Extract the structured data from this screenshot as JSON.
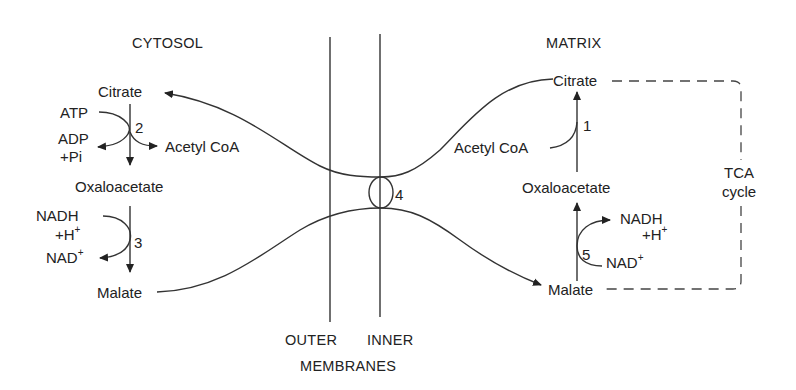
{
  "diagram": {
    "regions": {
      "cytosol": "CYTOSOL",
      "matrix": "MATRIX"
    },
    "membranes": {
      "outer": "OUTER",
      "inner": "INNER",
      "caption": "MEMBRANES"
    },
    "cytosol": {
      "citrate": "Citrate",
      "atp": "ATP",
      "adp": "ADP",
      "pi": "+Pi",
      "acetyl_coa": "Acetyl CoA",
      "oxaloacetate": "Oxaloacetate",
      "nadh": "NADH",
      "h_plus": "+H",
      "h_plus_sup": "+",
      "nad": "NAD",
      "nad_sup": "+",
      "malate": "Malate"
    },
    "matrix": {
      "citrate": "Citrate",
      "acetyl_coa": "Acetyl CoA",
      "oxaloacetate": "Oxaloacetate",
      "nadh": "NADH",
      "h_plus": "+H",
      "h_plus_sup": "+",
      "nad": "NAD",
      "nad_sup": "+",
      "malate": "Malate",
      "tca_line1": "TCA",
      "tca_line2": "cycle"
    },
    "steps": {
      "step1": "1",
      "step2": "2",
      "step3": "3",
      "step4": "4",
      "step5": "5"
    },
    "colors": {
      "ink": "#222222",
      "background": "#ffffff"
    }
  }
}
